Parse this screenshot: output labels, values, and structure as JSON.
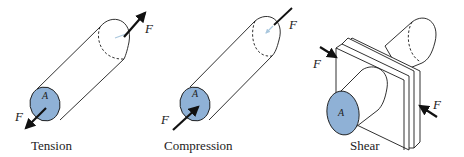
{
  "colors": {
    "area_fill": "#8fb1d6",
    "stroke": "#1a1a1a",
    "hidden_arrow": "#a9c7dd"
  },
  "panels": [
    {
      "caption": "Tension",
      "force_label": "F",
      "area_label": "A"
    },
    {
      "caption": "Compression",
      "force_label": "F",
      "area_label": "A"
    },
    {
      "caption": "Shear",
      "force_label": "F",
      "area_label": "A"
    }
  ]
}
